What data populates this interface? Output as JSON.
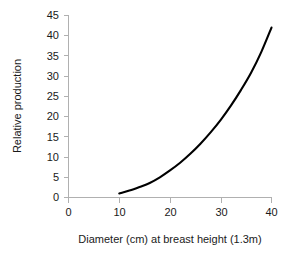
{
  "chart_data": {
    "type": "line",
    "title": "",
    "xlabel": "Diameter (cm) at breast height (1.3m)",
    "ylabel": "Relative production",
    "xlim": [
      0,
      40
    ],
    "ylim": [
      0,
      45
    ],
    "xticks": [
      0,
      10,
      20,
      30,
      40
    ],
    "yticks": [
      0,
      5,
      10,
      15,
      20,
      25,
      30,
      35,
      40,
      45
    ],
    "xtick_labels": [
      "0",
      "10",
      "20",
      "30",
      "40"
    ],
    "ytick_labels": [
      "0",
      "5",
      "10",
      "15",
      "20",
      "25",
      "30",
      "35",
      "40",
      "45"
    ],
    "grid": false,
    "legend": null,
    "series": [
      {
        "name": "Relative production",
        "color": "#000000",
        "x": [
          10,
          12,
          14,
          16,
          18,
          20,
          22,
          24,
          26,
          28,
          30,
          32,
          34,
          36,
          38,
          40
        ],
        "values": [
          1.0,
          1.7,
          2.6,
          3.6,
          5.0,
          6.7,
          8.6,
          10.8,
          13.3,
          16.1,
          19.2,
          22.7,
          26.6,
          30.9,
          36.0,
          42.0
        ]
      }
    ]
  },
  "axes": {
    "axis_color": "#b0b0b0",
    "tick_color": "#b0b0b0",
    "label_color": "#1a1a1a"
  }
}
